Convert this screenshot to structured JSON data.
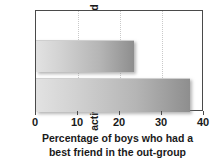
{
  "chart_data": {
    "type": "bar",
    "orientation": "horizontal",
    "title": "",
    "subtitle": "",
    "xlabel_lines": [
      "Percentage of boys who had a",
      "best friend in the out-group"
    ],
    "ylabel_lines": [
      "After cooperative",
      "activities were introduced"
    ],
    "categories": [
      "No",
      "Yes"
    ],
    "category_labels_visible": false,
    "values": [
      23.3,
      36.7
    ],
    "xlim": [
      0,
      40
    ],
    "xticks": [
      0,
      10,
      20,
      30,
      40
    ],
    "xtick_labels": [
      "0",
      "10",
      "20",
      "30",
      "40"
    ],
    "grid": "vertical-dotted",
    "legend": "none",
    "bar_gradient_from": "#e2e2e2",
    "bar_gradient_to": "#8e8e8e",
    "axis_color": "#4a4a4a",
    "background_color": "#ffffff"
  }
}
